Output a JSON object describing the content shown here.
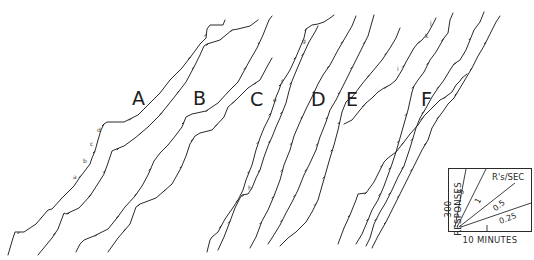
{
  "figure": {
    "panel_labels": [
      "A",
      "B",
      "C",
      "D",
      "E",
      "F"
    ],
    "event_labels": [
      "a",
      "b",
      "c",
      "d",
      "e",
      "f",
      "g",
      "h",
      "i",
      "j",
      "k"
    ],
    "inset": {
      "ylabel": "300 RESPONSES",
      "xlabel": "10 MINUTES",
      "rate_header": "R's/SEC",
      "rate_lines": [
        "3",
        "1",
        "0.5",
        "0.25"
      ]
    }
  },
  "chart_data": {
    "type": "line",
    "title": "",
    "xlabel": "10 MINUTES",
    "ylabel": "300 RESPONSES",
    "grid": false,
    "legend": {
      "position": "bottom-right inset",
      "title": "R's/SEC",
      "entries": [
        "3",
        "1",
        "0.5",
        "0.25"
      ]
    },
    "scale": {
      "x_minutes_per_unit": 10,
      "y_responses_per_unit": 300
    },
    "series": [
      {
        "name": "A",
        "panel": "A",
        "annotations": [
          "a",
          "b",
          "c",
          "d"
        ]
      },
      {
        "name": "B",
        "panel": "B",
        "annotations": []
      },
      {
        "name": "C",
        "panel": "C",
        "annotations": [
          "e",
          "f",
          "g",
          "h",
          "k"
        ]
      },
      {
        "name": "D",
        "panel": "D",
        "annotations": []
      },
      {
        "name": "E",
        "panel": "E",
        "annotations": []
      },
      {
        "name": "F",
        "panel": "F",
        "annotations": [
          "i",
          "j"
        ]
      }
    ],
    "slope_reference_rates": [
      3,
      1,
      0.5,
      0.25
    ]
  }
}
